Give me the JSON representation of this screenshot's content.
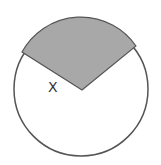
{
  "diagram": {
    "type": "circle-sector",
    "circle": {
      "cx": 81,
      "cy": 89,
      "r": 67,
      "stroke": "#555555",
      "fill": "#ffffff"
    },
    "sector": {
      "vertex": [
        82,
        90
      ],
      "start_point": [
        22,
        52
      ],
      "end_point": [
        136,
        46
      ],
      "fill": "#a8a8a8",
      "stroke": "#555555"
    },
    "angle_label": {
      "text": "X",
      "x": 48,
      "y": 92
    }
  }
}
